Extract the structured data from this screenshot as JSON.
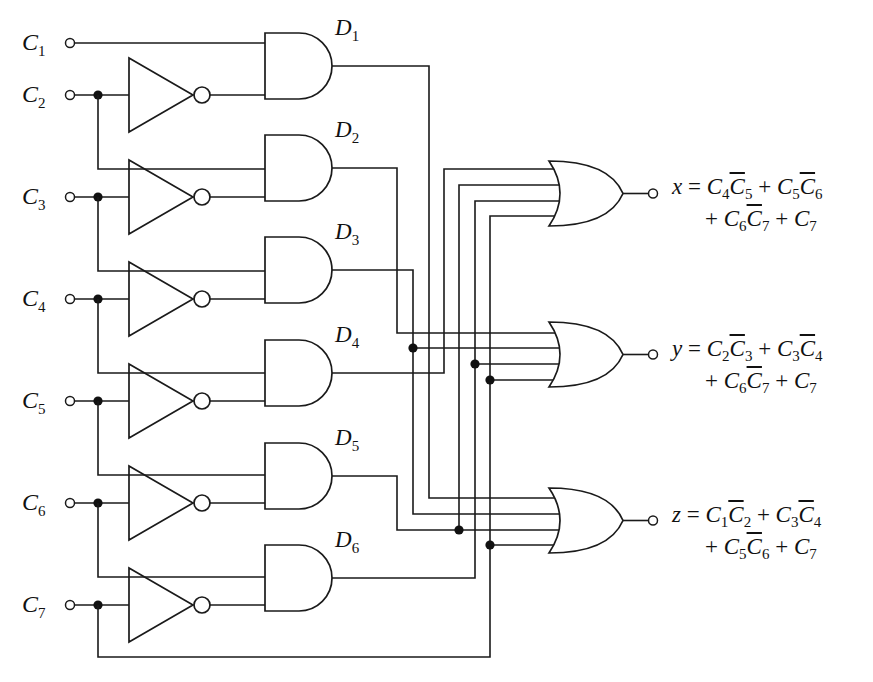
{
  "diagram": {
    "type": "combinational-logic-circuit",
    "inputs": [
      {
        "name": "C",
        "sub": "1",
        "y": 43
      },
      {
        "name": "C",
        "sub": "2",
        "y": 95
      },
      {
        "name": "C",
        "sub": "3",
        "y": 197
      },
      {
        "name": "C",
        "sub": "4",
        "y": 299
      },
      {
        "name": "C",
        "sub": "5",
        "y": 401
      },
      {
        "name": "C",
        "sub": "6",
        "y": 503
      },
      {
        "name": "C",
        "sub": "7",
        "y": 605
      }
    ],
    "and_gates": [
      {
        "label": "D",
        "sub": "1",
        "inputs": [
          "C1",
          "NOT C2"
        ]
      },
      {
        "label": "D",
        "sub": "2",
        "inputs": [
          "C2",
          "NOT C3"
        ]
      },
      {
        "label": "D",
        "sub": "3",
        "inputs": [
          "C3",
          "NOT C4"
        ]
      },
      {
        "label": "D",
        "sub": "4",
        "inputs": [
          "C4",
          "NOT C5"
        ]
      },
      {
        "label": "D",
        "sub": "5",
        "inputs": [
          "C5",
          "NOT C6"
        ]
      },
      {
        "label": "D",
        "sub": "6",
        "inputs": [
          "C6",
          "NOT C7"
        ]
      }
    ],
    "inverter_count": 6,
    "outputs": [
      {
        "name": "x",
        "line1": [
          {
            "t": "C",
            "s": "4"
          },
          {
            "t": "C",
            "s": "5",
            "bar": true
          },
          {
            "op": "+"
          },
          {
            "t": "C",
            "s": "5"
          },
          {
            "t": "C",
            "s": "6",
            "bar": true
          }
        ],
        "line2": [
          {
            "op": "+"
          },
          {
            "t": "C",
            "s": "6"
          },
          {
            "t": "C",
            "s": "7",
            "bar": true
          },
          {
            "op": "+"
          },
          {
            "t": "C",
            "s": "7"
          }
        ],
        "text": "x = C4C̄5 + C5C̄6 + C6C̄7 + C7"
      },
      {
        "name": "y",
        "line1": [
          {
            "t": "C",
            "s": "2"
          },
          {
            "t": "C",
            "s": "3",
            "bar": true
          },
          {
            "op": "+"
          },
          {
            "t": "C",
            "s": "3"
          },
          {
            "t": "C",
            "s": "4",
            "bar": true
          }
        ],
        "line2": [
          {
            "op": "+"
          },
          {
            "t": "C",
            "s": "6"
          },
          {
            "t": "C",
            "s": "7",
            "bar": true
          },
          {
            "op": "+"
          },
          {
            "t": "C",
            "s": "7"
          }
        ],
        "text": "y = C2C̄3 + C3C̄4 + C6C̄7 + C7"
      },
      {
        "name": "z",
        "line1": [
          {
            "t": "C",
            "s": "1"
          },
          {
            "t": "C",
            "s": "2",
            "bar": true
          },
          {
            "op": "+"
          },
          {
            "t": "C",
            "s": "3"
          },
          {
            "t": "C",
            "s": "4",
            "bar": true
          }
        ],
        "line2": [
          {
            "op": "+"
          },
          {
            "t": "C",
            "s": "5"
          },
          {
            "t": "C",
            "s": "6",
            "bar": true
          },
          {
            "op": "+"
          },
          {
            "t": "C",
            "s": "7"
          }
        ],
        "text": "z = C1C̄2 + C3C̄4 + C5C̄6 + C7"
      }
    ],
    "colors": {
      "line": "#1a1a1a",
      "background": "#ffffff"
    }
  }
}
